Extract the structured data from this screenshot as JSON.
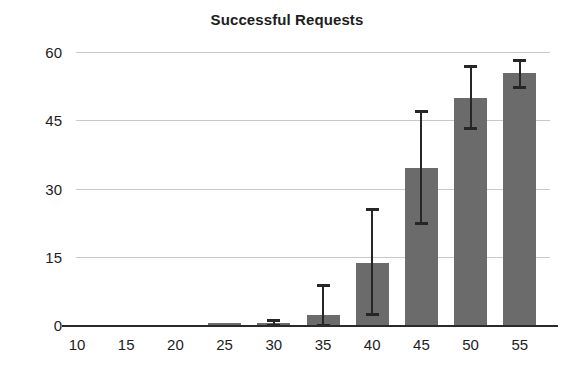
{
  "chart_data": {
    "type": "bar",
    "title": "Successful Requests",
    "xlabel": "",
    "ylabel": "",
    "categories": [
      "10",
      "15",
      "20",
      "25",
      "30",
      "35",
      "40",
      "45",
      "50",
      "55"
    ],
    "values": [
      0,
      0,
      0,
      0.2,
      0.5,
      2.2,
      13.7,
      34.5,
      49.8,
      55.3
    ],
    "error_low": [
      0,
      0,
      0,
      0,
      0,
      0,
      2.4,
      22.5,
      43.2,
      52.2
    ],
    "error_high": [
      0,
      0,
      0,
      0,
      1.2,
      8.8,
      25.6,
      47.0,
      57.0,
      58.2
    ],
    "yticks": [
      0,
      15,
      30,
      45,
      60
    ],
    "ylim": [
      0,
      60
    ],
    "grid": true,
    "legend": "none",
    "bar_color": "#6b6b6b",
    "error_color": "#262626",
    "grid_color": "#c9c9c9",
    "axis_color": "#2a2a2a"
  },
  "axis": {
    "ytick_labels": [
      "0",
      "15",
      "30",
      "45",
      "60"
    ],
    "xtick_labels": [
      "10",
      "15",
      "20",
      "25",
      "30",
      "35",
      "40",
      "45",
      "50",
      "55"
    ]
  }
}
